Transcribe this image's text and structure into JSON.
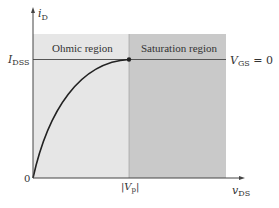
{
  "diagram": {
    "y_axis": {
      "label": "i",
      "label_sub": "D"
    },
    "x_axis": {
      "label": "v",
      "label_sub": "DS"
    },
    "origin_label": "0",
    "idss_label": {
      "main": "I",
      "sub": "DSS"
    },
    "vp_label": {
      "main": "|V",
      "sub": "p",
      "close": "|"
    },
    "curve_label": {
      "main": "V",
      "sub": "GS",
      "rest": " = 0"
    },
    "regions": [
      {
        "name": "Ohmic region",
        "color": "#e6e6e6"
      },
      {
        "name": "Saturation region",
        "color": "#c9c9c9"
      }
    ],
    "colors": {
      "axis": "#444444",
      "curve": "#222222",
      "text": "#333333"
    }
  }
}
